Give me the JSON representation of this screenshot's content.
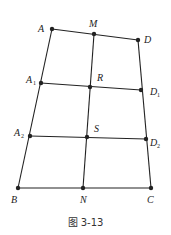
{
  "figure": {
    "caption": "图 3-13",
    "line_color": "#222222",
    "points": [
      {
        "id": "A",
        "label": "A",
        "sub": "",
        "x": 52,
        "y": 29,
        "lx": 38,
        "ly": 32
      },
      {
        "id": "M",
        "label": "M",
        "sub": "",
        "x": 94,
        "y": 34,
        "lx": 89,
        "ly": 27
      },
      {
        "id": "D",
        "label": "D",
        "sub": "",
        "x": 138,
        "y": 40,
        "lx": 144,
        "ly": 43
      },
      {
        "id": "A1",
        "label": "A",
        "sub": "1",
        "x": 41,
        "y": 83,
        "lx": 26,
        "ly": 83
      },
      {
        "id": "R",
        "label": "R",
        "sub": "",
        "x": 90,
        "y": 87,
        "lx": 97,
        "ly": 81
      },
      {
        "id": "D1",
        "label": "D",
        "sub": "1",
        "x": 141,
        "y": 90,
        "lx": 150,
        "ly": 95
      },
      {
        "id": "A2",
        "label": "A",
        "sub": "2",
        "x": 30,
        "y": 136,
        "lx": 14,
        "ly": 136
      },
      {
        "id": "S",
        "label": "S",
        "sub": "",
        "x": 87,
        "y": 137,
        "lx": 94,
        "ly": 132
      },
      {
        "id": "D2",
        "label": "D",
        "sub": "2",
        "x": 146,
        "y": 139,
        "lx": 150,
        "ly": 146
      },
      {
        "id": "B",
        "label": "B",
        "sub": "",
        "x": 18,
        "y": 188,
        "lx": 11,
        "ly": 203
      },
      {
        "id": "N",
        "label": "N",
        "sub": "",
        "x": 83,
        "y": 188,
        "lx": 80,
        "ly": 203
      },
      {
        "id": "C",
        "label": "C",
        "sub": "",
        "x": 151,
        "y": 188,
        "lx": 147,
        "ly": 203
      }
    ],
    "segments": [
      [
        "A",
        "D"
      ],
      [
        "A1",
        "D1"
      ],
      [
        "A2",
        "D2"
      ],
      [
        "B",
        "C"
      ],
      [
        "A",
        "B"
      ],
      [
        "M",
        "N"
      ],
      [
        "D",
        "C"
      ]
    ]
  }
}
